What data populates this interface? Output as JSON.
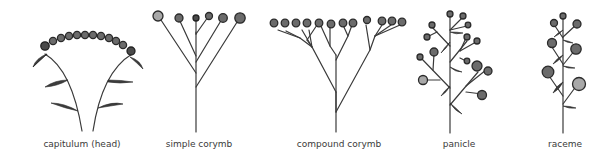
{
  "figure": {
    "items": [
      {
        "id": "capitulum",
        "label": "capitulum (head)",
        "center_x": 82
      },
      {
        "id": "simple-corymb",
        "label": "simple corymb",
        "center_x": 199
      },
      {
        "id": "compound-corymb",
        "label": "compound corymb",
        "center_x": 339
      },
      {
        "id": "panicle",
        "label": "panicle",
        "center_x": 459
      },
      {
        "id": "raceme",
        "label": "raceme",
        "center_x": 565
      }
    ],
    "colors": {
      "background": "#ffffff",
      "ink": "#3a3a3a",
      "flower_fill": "#6b6b6b"
    }
  }
}
